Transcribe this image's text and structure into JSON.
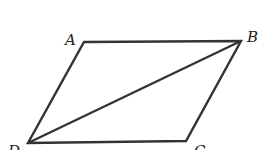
{
  "diagram": {
    "type": "parallelogram",
    "stroke_color": "#333333",
    "vertices": [
      {
        "label": "A",
        "x": 84,
        "y": 42,
        "lx": 65,
        "ly": 45
      },
      {
        "label": "B",
        "x": 241,
        "y": 41,
        "lx": 247,
        "ly": 42
      },
      {
        "label": "C",
        "x": 186,
        "y": 141,
        "lx": 194,
        "ly": 156
      },
      {
        "label": "D",
        "x": 28,
        "y": 143,
        "lx": 8,
        "ly": 156
      }
    ],
    "edges": [
      [
        "A",
        "B"
      ],
      [
        "B",
        "C"
      ],
      [
        "C",
        "D"
      ],
      [
        "D",
        "A"
      ]
    ],
    "diagonals": [
      [
        "D",
        "B"
      ]
    ]
  }
}
